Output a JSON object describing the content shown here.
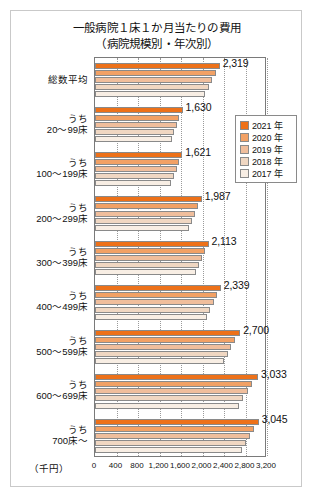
{
  "title": {
    "main": "一般病院１床１か月当たりの費用",
    "sub": "（病院規模別・年次別）"
  },
  "axis": {
    "unit": "（千円）",
    "ticks": [
      "0",
      "400",
      "800",
      "1,200",
      "1,600",
      "2,000",
      "2,400",
      "2,800",
      "3,200"
    ]
  },
  "legend": {
    "items": [
      {
        "label": "2021 年",
        "color": "#ED7119"
      },
      {
        "label": "2020 年",
        "color": "#F2A165"
      },
      {
        "label": "2019 年",
        "color": "#F0BE9C"
      },
      {
        "label": "2018 年",
        "color": "#F0D7C2"
      },
      {
        "label": "2017 年",
        "color": "#F8EEE4"
      }
    ]
  },
  "chart_data": {
    "type": "bar",
    "orientation": "horizontal",
    "xlabel": "（千円）",
    "ylabel": "",
    "xlim": [
      0,
      3200
    ],
    "xticks": [
      0,
      400,
      800,
      1200,
      1600,
      2000,
      2400,
      2800,
      3200
    ],
    "grid": true,
    "legend_position": "right-upper",
    "categories": [
      "総数平均",
      "うち 20〜99床",
      "うち 100〜199床",
      "うち 200〜299床",
      "うち 300〜399床",
      "うち 400〜499床",
      "うち 500〜599床",
      "うち 600〜699床",
      "うち 700床〜"
    ],
    "category_lines": [
      [
        "",
        "総数平均"
      ],
      [
        "うち",
        "20〜99床"
      ],
      [
        "うち",
        "100〜199床"
      ],
      [
        "うち",
        "200〜299床"
      ],
      [
        "うち",
        "300〜399床"
      ],
      [
        "うち",
        "400〜499床"
      ],
      [
        "うち",
        "500〜599床"
      ],
      [
        "うち",
        "600〜699床"
      ],
      [
        "うち",
        "700床〜"
      ]
    ],
    "series": [
      {
        "name": "2021 年",
        "color": "#ED7119",
        "values": [
          2319,
          1630,
          1621,
          1987,
          2113,
          2339,
          2700,
          3033,
          3045
        ]
      },
      {
        "name": "2020 年",
        "color": "#F2A165",
        "values": [
          2245,
          1572,
          1566,
          1920,
          2049,
          2274,
          2610,
          2930,
          2960
        ]
      },
      {
        "name": "2019 年",
        "color": "#F0BE9C",
        "values": [
          2180,
          1522,
          1520,
          1866,
          1995,
          2212,
          2538,
          2844,
          2888
        ]
      },
      {
        "name": "2018 年",
        "color": "#F0D7C2",
        "values": [
          2112,
          1470,
          1468,
          1808,
          1936,
          2146,
          2466,
          2757,
          2814
        ]
      },
      {
        "name": "2017 年",
        "color": "#F8EEE4",
        "values": [
          2052,
          1424,
          1420,
          1752,
          1880,
          2082,
          2394,
          2678,
          2744
        ]
      }
    ],
    "value_labels": [
      "2,319",
      "1,630",
      "1,621",
      "1,987",
      "2,113",
      "2,339",
      "2,700",
      "3,033",
      "3,045"
    ],
    "value_label_series": "2021 年"
  }
}
